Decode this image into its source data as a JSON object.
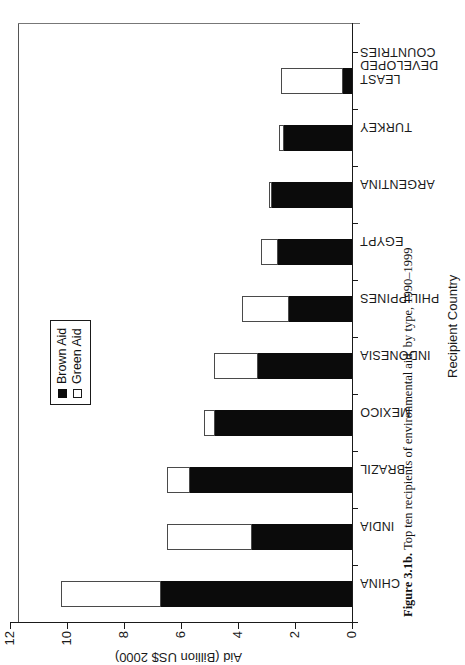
{
  "figure": {
    "caption_label": "Figure 3.1b.",
    "caption_text": "Top ten recipients of environmental aid, by type, 1990–1999"
  },
  "legend": {
    "items": [
      {
        "label": "Brown Aid",
        "swatch": "filled-black-square",
        "color": "#0b0b0b"
      },
      {
        "label": "Green Aid",
        "swatch": "open-white-square",
        "color": "#ffffff"
      }
    ]
  },
  "axes": {
    "value_axis_title": "Aid (Billion US$ 2000)",
    "category_axis_title": "Recipient Country",
    "value_ticks": [
      "0",
      "2",
      "4",
      "6",
      "8",
      "10",
      "12"
    ]
  },
  "chart_data": {
    "type": "bar",
    "title": "Top ten recipients of environmental aid, by type, 1990–1999",
    "xlabel": "Recipient Country",
    "ylabel": "Aid (Billion US$ 2000)",
    "ylim": [
      0,
      12
    ],
    "ytick_step": 2,
    "grid": false,
    "orientation": "vertical-bars-rotated-90ccw-on-page",
    "stacked": true,
    "legend_position": "inside-upper-center",
    "categories": [
      "CHINA",
      "INDIA",
      "BRAZIL",
      "MEXICO",
      "INDONESIA",
      "PHILIPPINES",
      "EGYPT",
      "ARGENTINA",
      "TURKEY",
      "LEAST DEVELOPED COUNTRIES"
    ],
    "series": [
      {
        "name": "Brown Aid",
        "color": "#0b0b0b",
        "values": [
          6.7,
          3.5,
          5.7,
          4.8,
          3.3,
          2.2,
          2.6,
          2.8,
          2.4,
          0.3
        ]
      },
      {
        "name": "Green Aid",
        "color": "#ffffff",
        "values": [
          3.5,
          3.0,
          0.8,
          0.4,
          1.55,
          1.65,
          0.6,
          0.1,
          0.15,
          2.2
        ]
      }
    ],
    "totals": [
      10.2,
      6.5,
      6.5,
      5.2,
      4.85,
      3.85,
      3.2,
      2.9,
      2.55,
      2.5
    ]
  }
}
